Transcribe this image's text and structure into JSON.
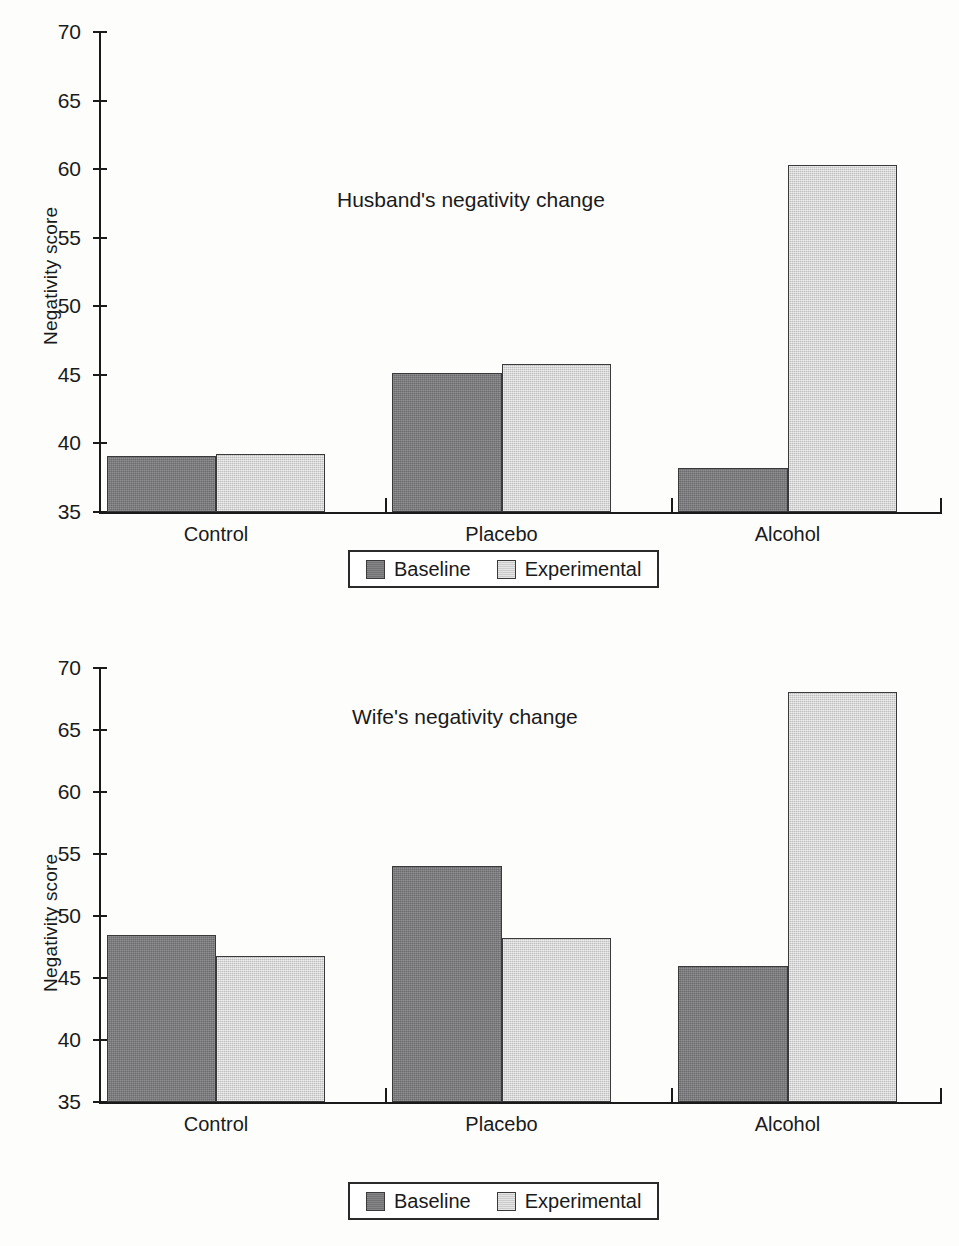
{
  "figure": {
    "background_color": "#fdfdfc",
    "baseline_color": "#78787b",
    "experimental_color": "#d7d7d7",
    "axis_color": "#1a1a1a"
  },
  "legend": {
    "baseline_label": "Baseline",
    "experimental_label": "Experimental"
  },
  "chart_data": [
    {
      "type": "bar",
      "title": "Husband's negativity change",
      "xlabel": "",
      "ylabel": "Negativity score",
      "categories": [
        "Control",
        "Placebo",
        "Alcohol"
      ],
      "series": [
        {
          "name": "Baseline",
          "values": [
            39.1,
            45.1,
            38.2
          ]
        },
        {
          "name": "Experimental",
          "values": [
            39.2,
            45.8,
            60.3
          ]
        }
      ],
      "ylim": [
        35,
        70
      ],
      "yticks": [
        35,
        40,
        45,
        50,
        55,
        60,
        65,
        70
      ],
      "grid": false,
      "legend_position": "bottom-center"
    },
    {
      "type": "bar",
      "title": "Wife's negativity change",
      "xlabel": "",
      "ylabel": "Negativity score",
      "categories": [
        "Control",
        "Placebo",
        "Alcohol"
      ],
      "series": [
        {
          "name": "Baseline",
          "values": [
            48.5,
            54.0,
            46.0
          ]
        },
        {
          "name": "Experimental",
          "values": [
            46.8,
            48.2,
            68.1
          ]
        }
      ],
      "ylim": [
        35,
        70
      ],
      "yticks": [
        35,
        40,
        45,
        50,
        55,
        60,
        65,
        70
      ],
      "grid": false,
      "legend_position": "bottom-center"
    }
  ]
}
